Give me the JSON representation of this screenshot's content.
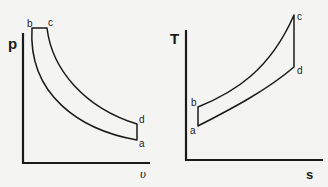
{
  "diagrams": [
    {
      "name": "p-v diagram",
      "y_axis_label": "p",
      "x_axis_label": "υ",
      "points": {
        "a": "a",
        "b": "b",
        "c": "c",
        "d": "d"
      }
    },
    {
      "name": "T-s diagram",
      "y_axis_label": "T",
      "x_axis_label": "s",
      "points": {
        "a": "a",
        "b": "b",
        "c": "c",
        "d": "d"
      }
    }
  ],
  "colors": {
    "line": "#1a1a1a",
    "background": "#f4f4f2"
  }
}
